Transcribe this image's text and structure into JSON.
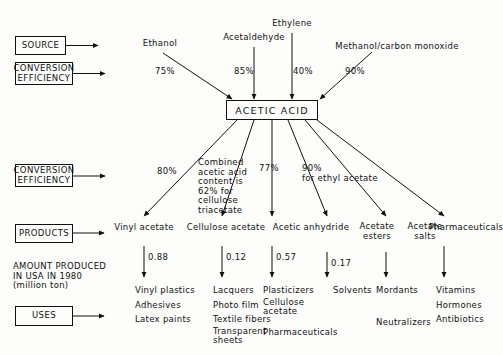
{
  "diagram": {
    "key_boxes": [
      {
        "id": "source",
        "label": "SOURCE"
      },
      {
        "id": "conversion-efficiency-top",
        "label": "CONVERSION\nEFFICIENCY"
      },
      {
        "id": "conversion-efficiency-mid",
        "label": "CONVERSION\nEFFICIENCY"
      },
      {
        "id": "products",
        "label": "PRODUCTS"
      },
      {
        "id": "uses",
        "label": "USES"
      }
    ],
    "amount_caption": "AMOUNT PRODUCED\nIN USA IN 1980\n(million ton)",
    "center_node": "ACETIC  ACID",
    "sources": [
      {
        "name": "Ethanol",
        "efficiency": "75%"
      },
      {
        "name": "Acetaldehyde",
        "efficiency": "85%"
      },
      {
        "name": "Ethylene",
        "efficiency": "40%"
      },
      {
        "name": "Methanol/carbon monoxide",
        "efficiency": "90%"
      }
    ],
    "branch_notes": [
      {
        "text": "80%"
      },
      {
        "text": "Combined\nacetic acid\ncontent is\n62% for\ncellulose\ntriacetate"
      },
      {
        "text": "77%"
      },
      {
        "text": "90%\nfor ethyl acetate"
      }
    ],
    "products": [
      {
        "name": "Vinyl acetate",
        "amount": "0.88",
        "uses": [
          "Vinyl plastics",
          "Adhesives",
          "Latex paints"
        ]
      },
      {
        "name": "Cellulose acetate",
        "amount": "0.12",
        "uses": [
          "Lacquers",
          "Photo film",
          "Textile fibers",
          "Transparent\nsheets"
        ]
      },
      {
        "name": "Acetic anhydride",
        "amount": "0.57",
        "uses": [
          "Plasticizers",
          "Cellulose\nacetate",
          "Pharmaceuticals"
        ]
      },
      {
        "name": "Acetate\nesters",
        "amount": "0.17",
        "uses": [
          "Solvents"
        ]
      },
      {
        "name": "Acetate\nsalts",
        "amount": "",
        "uses": [
          "Mordants",
          "Neutralizers"
        ]
      },
      {
        "name": "Pharmaceuticals",
        "amount": "",
        "uses": [
          "Vitamins",
          "Hormones",
          "Antibiotics"
        ]
      }
    ],
    "colors": {
      "ink": "#111111",
      "paper": "#fdfdfb"
    }
  }
}
